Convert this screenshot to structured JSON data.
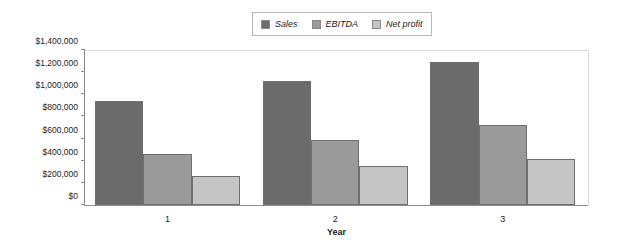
{
  "chart_data": {
    "type": "bar",
    "title": "",
    "xlabel": "Year",
    "ylabel": "",
    "categories": [
      "1",
      "2",
      "3"
    ],
    "series": [
      {
        "name": "Sales",
        "values": [
          940000,
          1120000,
          1290000
        ],
        "color": "#6b6b6b"
      },
      {
        "name": "EBITDA",
        "values": [
          460000,
          590000,
          720000
        ],
        "color": "#9a9a9a"
      },
      {
        "name": "Net profit",
        "values": [
          260000,
          350000,
          420000
        ],
        "color": "#c5c5c5"
      }
    ],
    "ylim": [
      0,
      1400000
    ],
    "ytick_values": [
      0,
      200000,
      400000,
      600000,
      800000,
      1000000,
      1200000,
      1400000
    ],
    "ytick_labels": [
      "$0",
      "$200,000",
      "$400,000",
      "$600,000",
      "$800,000",
      "$1,000,000",
      "$1,200,000",
      "$1,400,000"
    ],
    "grid": false,
    "legend_position": "top-center",
    "legend_entries": [
      "Sales",
      "EBITDA",
      "Net profit"
    ]
  },
  "colors": {
    "sales": "#6b6b6b",
    "ebitda": "#9a9a9a",
    "net_profit": "#c5c5c5",
    "axis": "#8d8d8d",
    "text": "#1c1c1c",
    "background": "#ffffff"
  }
}
